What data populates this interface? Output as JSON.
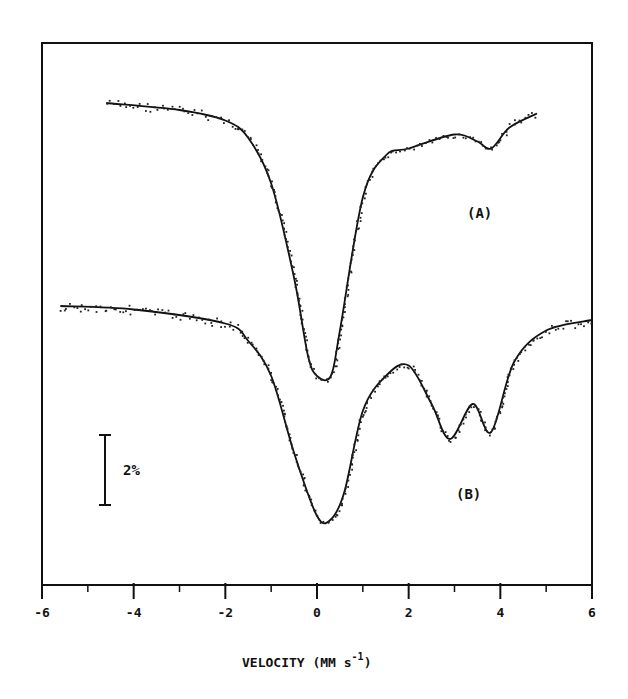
{
  "chart_data": {
    "type": "line",
    "title": "",
    "xlabel": "VELOCITY (MM s-1)",
    "xlabel_parts": {
      "main": "VELOCITY (MM s",
      "sup": "-1",
      "close": ")"
    },
    "ylabel": "",
    "xlim": [
      -6,
      6
    ],
    "x_ticks": [
      -6,
      -4,
      -2,
      0,
      2,
      4,
      6
    ],
    "x_tick_labels": [
      "-6",
      "-4",
      "-2",
      "0",
      "2",
      "4",
      "6"
    ],
    "x_minor_ticks": [
      -5,
      -3,
      -1,
      1,
      3,
      5
    ],
    "grid": false,
    "legend": null,
    "scale_bar": {
      "label": "2%",
      "value_percent": 2
    },
    "y_units": "absorption (% drop from baseline); spectra offset vertically",
    "series": [
      {
        "name": "(A)",
        "baseline_offset_px": 103,
        "x": [
          -4.6,
          -3.0,
          -2.0,
          -1.5,
          -1.0,
          -0.5,
          -0.2,
          0.0,
          0.3,
          0.5,
          1.0,
          1.5,
          2.0,
          3.0,
          3.5,
          3.8,
          4.2,
          4.8
        ],
        "absorption_percent": [
          0.0,
          0.2,
          0.5,
          1.0,
          2.3,
          5.0,
          7.2,
          7.8,
          7.8,
          6.5,
          2.7,
          1.5,
          1.3,
          0.9,
          1.1,
          1.3,
          0.7,
          0.3
        ]
      },
      {
        "name": "(B)",
        "baseline_offset_px": 306,
        "x": [
          -5.6,
          -4.0,
          -2.0,
          -1.5,
          -1.0,
          -0.5,
          0.0,
          0.3,
          0.6,
          1.0,
          1.5,
          2.0,
          2.5,
          2.9,
          3.4,
          3.8,
          4.3,
          5.0,
          6.0
        ],
        "absorption_percent": [
          0.0,
          0.1,
          0.5,
          1.0,
          2.0,
          4.2,
          6.0,
          6.1,
          5.3,
          3.0,
          2.0,
          1.7,
          2.8,
          3.8,
          2.8,
          3.6,
          1.6,
          0.7,
          0.4
        ]
      }
    ],
    "annotations": [
      {
        "text": "(A)",
        "x": 3.6,
        "near_series": "A"
      },
      {
        "text": "(B)",
        "x": 3.3,
        "near_series": "B"
      }
    ]
  },
  "labels": {
    "series_a": "(A)",
    "series_b": "(B)",
    "scale_bar": "2%",
    "x_title_main": "VELOCITY (MM s",
    "x_title_sup": "-1",
    "x_title_close": ")"
  },
  "colors": {
    "ink": "#111111",
    "background": "#ffffff"
  }
}
